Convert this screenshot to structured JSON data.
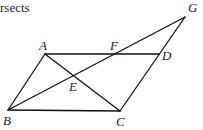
{
  "caption": {
    "text": "rsects"
  },
  "figure": {
    "line_color": "#111111",
    "label_color": "#222222",
    "points": {
      "A": {
        "label": "A",
        "x": 45,
        "y": 54
      },
      "B": {
        "label": "B",
        "x": 8,
        "y": 110
      },
      "C": {
        "label": "C",
        "x": 120,
        "y": 111
      },
      "D": {
        "label": "D",
        "x": 159,
        "y": 54
      },
      "E": {
        "label": "E",
        "x": 74,
        "y": 77
      },
      "F": {
        "label": "F",
        "x": 113,
        "y": 54
      },
      "G": {
        "label": "G",
        "x": 185,
        "y": 17
      }
    },
    "segments": [
      {
        "from": "A",
        "to": "D",
        "name": "AD"
      },
      {
        "from": "A",
        "to": "B",
        "name": "AB"
      },
      {
        "from": "B",
        "to": "C",
        "name": "BC"
      },
      {
        "from": "C",
        "to": "G",
        "name": "CG"
      },
      {
        "from": "A",
        "to": "C",
        "name": "AC"
      },
      {
        "from": "B",
        "to": "G",
        "name": "BG"
      }
    ]
  }
}
